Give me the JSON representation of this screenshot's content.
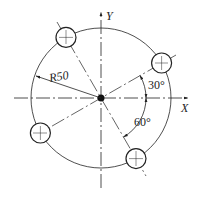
{
  "diagram": {
    "axes": {
      "x_label": "X",
      "y_label": "Y"
    },
    "radius_label": "R50",
    "angle_labels": [
      "30°",
      "60°"
    ],
    "holes": [
      {
        "angle_deg": 30
      },
      {
        "angle_deg": 120
      },
      {
        "angle_deg": 210
      },
      {
        "angle_deg": 300
      }
    ],
    "colors": {
      "line": "#222222",
      "background": "#ffffff"
    }
  }
}
